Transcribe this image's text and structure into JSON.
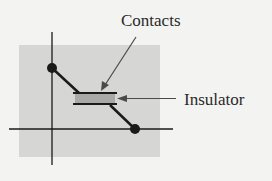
{
  "diagram": {
    "labels": {
      "contacts": "Contacts",
      "insulator": "Insulator"
    },
    "colors": {
      "background": "#f3f3f1",
      "panel": "#d6d6d4",
      "insulator_fill": "#a9a9a7",
      "line": "#1a1a1a",
      "arrow": "#4a4a4a"
    }
  }
}
